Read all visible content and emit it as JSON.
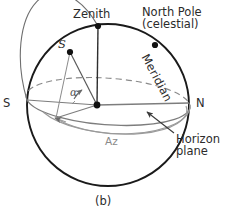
{
  "figure": {
    "caption": "(b)",
    "type": "celestial-sphere-horizon-coordinates-diagram"
  },
  "labels": {
    "zenith": "Zenith",
    "north_pole_line1": "North Pole",
    "north_pole_line2": "(celestial)",
    "meridian": "Meridian",
    "south_cardinal": "S",
    "north_cardinal": "N",
    "star": "S",
    "altitude_angle": "α",
    "azimuth": "Az",
    "horizon_line1": "Horizon",
    "horizon_line2": "plane"
  },
  "colors": {
    "sphere_outline": "#1a1a1a",
    "horizon_solid": "#7d7d7d",
    "horizon_dashed": "#8a8a8a",
    "azimuth_arc": "#9a9a9a",
    "radii": "#555555",
    "marker": "#111111",
    "text": "#2b2b2b",
    "az_text": "#8a8a8a",
    "background": "#ffffff"
  },
  "geometry": {
    "sphere_center": [
      108,
      105
    ],
    "sphere_radius": 81,
    "zenith_point": [
      98,
      26
    ],
    "north_pole_point": [
      155,
      45
    ],
    "star_point": [
      70,
      52
    ],
    "observer_point": [
      97,
      105
    ],
    "south_point": [
      27,
      100
    ],
    "north_point": [
      189,
      103
    ],
    "horizon_foot_point": [
      56,
      118
    ]
  },
  "points": [
    {
      "name": "zenith-marker",
      "label": "Zenith"
    },
    {
      "name": "north-pole-marker",
      "label": "North Pole (celestial)"
    },
    {
      "name": "star-marker",
      "label": "S"
    },
    {
      "name": "observer-marker",
      "label": "observer"
    }
  ]
}
